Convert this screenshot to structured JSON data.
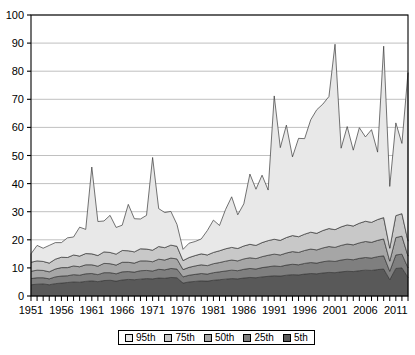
{
  "chart_data": {
    "type": "area",
    "title": "",
    "subtitle": "",
    "xlabel": "",
    "ylabel": "",
    "stacked": true,
    "grid": true,
    "grid_axis": "y",
    "legend_position": "bottom",
    "xlim": [
      1951,
      2013
    ],
    "ylim": [
      0,
      100
    ],
    "ytick_values": [
      0,
      10,
      20,
      30,
      40,
      50,
      60,
      70,
      80,
      90,
      100
    ],
    "ytick_labels": [
      "0",
      "10",
      "20",
      "30",
      "40",
      "50",
      "60",
      "70",
      "80",
      "90",
      "100"
    ],
    "xtick_labels": [
      "1951",
      "1956",
      "1961",
      "1966",
      "1971",
      "1976",
      "1981",
      "1986",
      "1991",
      "1996",
      "2001",
      "2006",
      "2011"
    ],
    "xtick_label_values": [
      1951,
      1956,
      1961,
      1966,
      1971,
      1976,
      1981,
      1986,
      1991,
      1996,
      2001,
      2006,
      2011
    ],
    "x": [
      1951,
      1952,
      1953,
      1954,
      1955,
      1956,
      1957,
      1958,
      1959,
      1960,
      1961,
      1962,
      1963,
      1964,
      1965,
      1966,
      1967,
      1968,
      1969,
      1970,
      1971,
      1972,
      1973,
      1974,
      1975,
      1976,
      1977,
      1978,
      1979,
      1980,
      1981,
      1982,
      1983,
      1984,
      1985,
      1986,
      1987,
      1988,
      1989,
      1990,
      1991,
      1992,
      1993,
      1994,
      1995,
      1996,
      1997,
      1998,
      1999,
      2000,
      2001,
      2002,
      2003,
      2004,
      2005,
      2006,
      2007,
      2008,
      2009,
      2010,
      2011,
      2012,
      2013
    ],
    "series": [
      {
        "name": "5th",
        "color": "#595959",
        "values": [
          4.0,
          4.2,
          4.3,
          4.0,
          4.4,
          4.6,
          4.8,
          5.0,
          4.9,
          5.2,
          5.4,
          5.1,
          5.5,
          5.6,
          5.3,
          5.7,
          5.9,
          5.8,
          6.0,
          6.2,
          6.1,
          6.4,
          6.3,
          6.6,
          6.5,
          4.6,
          5.0,
          5.2,
          5.4,
          5.3,
          5.6,
          5.8,
          6.0,
          6.2,
          6.1,
          6.4,
          6.6,
          6.5,
          6.8,
          7.0,
          7.2,
          7.1,
          7.4,
          7.6,
          7.5,
          7.8,
          8.0,
          7.9,
          8.2,
          8.4,
          8.3,
          8.6,
          8.8,
          8.7,
          9.0,
          9.2,
          9.1,
          9.4,
          9.6,
          5.8,
          9.8,
          10.0,
          6.6
        ]
      },
      {
        "name": "25th",
        "color": "#7f7f7f",
        "values": [
          2.2,
          2.3,
          2.2,
          2.1,
          2.4,
          2.5,
          2.4,
          2.6,
          2.5,
          2.7,
          2.6,
          2.5,
          2.8,
          2.7,
          2.6,
          2.9,
          2.8,
          2.7,
          3.0,
          2.9,
          2.8,
          3.1,
          3.0,
          3.2,
          3.1,
          2.2,
          2.4,
          2.5,
          2.6,
          2.5,
          2.7,
          2.8,
          2.9,
          3.0,
          2.9,
          3.1,
          3.2,
          3.1,
          3.3,
          3.4,
          3.5,
          3.4,
          3.6,
          3.7,
          3.6,
          3.8,
          3.9,
          3.8,
          4.0,
          4.1,
          4.0,
          4.2,
          4.3,
          4.2,
          4.4,
          4.5,
          4.4,
          4.6,
          4.7,
          3.0,
          4.8,
          4.9,
          3.4
        ]
      },
      {
        "name": "50th",
        "color": "#a6a6a6",
        "values": [
          2.6,
          2.7,
          2.6,
          2.5,
          2.8,
          3.0,
          2.9,
          3.1,
          3.0,
          3.2,
          3.1,
          3.0,
          3.3,
          3.2,
          3.1,
          3.4,
          3.3,
          3.2,
          3.5,
          3.4,
          3.3,
          3.6,
          3.5,
          3.7,
          3.6,
          2.6,
          2.8,
          3.0,
          3.1,
          3.0,
          3.2,
          3.3,
          3.5,
          3.6,
          3.5,
          3.7,
          3.8,
          3.7,
          3.9,
          4.1,
          4.2,
          4.1,
          4.3,
          4.5,
          4.4,
          4.6,
          4.8,
          4.7,
          4.9,
          5.1,
          5.0,
          5.2,
          5.4,
          5.3,
          5.5,
          5.7,
          5.6,
          5.8,
          6.0,
          3.6,
          6.2,
          6.4,
          4.2
        ]
      },
      {
        "name": "75th",
        "color": "#c8c8c8",
        "values": [
          3.2,
          3.3,
          3.2,
          3.1,
          3.5,
          3.7,
          3.6,
          3.9,
          3.8,
          4.0,
          3.9,
          3.8,
          4.1,
          4.0,
          3.9,
          4.2,
          4.1,
          4.0,
          4.3,
          4.2,
          4.1,
          4.5,
          4.4,
          4.6,
          4.5,
          3.2,
          3.5,
          3.7,
          3.9,
          3.8,
          4.0,
          4.2,
          4.4,
          4.5,
          4.4,
          4.6,
          4.8,
          4.7,
          5.0,
          5.2,
          5.3,
          5.2,
          5.5,
          5.7,
          5.6,
          5.8,
          6.0,
          5.9,
          6.2,
          6.4,
          6.3,
          6.6,
          6.8,
          6.7,
          7.0,
          7.2,
          7.1,
          7.4,
          7.6,
          4.6,
          7.8,
          8.0,
          5.3
        ]
      },
      {
        "name": "95th",
        "color": "#e8e8e8",
        "values": [
          3.0,
          5.5,
          4.7,
          6.3,
          5.9,
          5.2,
          7.0,
          6.4,
          10.3,
          8.6,
          30.9,
          12.1,
          11.0,
          13.2,
          9.5,
          9.0,
          16.5,
          11.8,
          10.6,
          12.0,
          33.0,
          13.5,
          12.5,
          12.0,
          7.8,
          4.0,
          5.1,
          5.0,
          5.3,
          8.7,
          11.5,
          9.0,
          14.0,
          18.0,
          12.0,
          15.0,
          25.0,
          20.0,
          24.0,
          18.0,
          51.0,
          33.0,
          40.0,
          28.0,
          35.0,
          34.0,
          40.0,
          44.0,
          45.0,
          47.0,
          66.0,
          28.0,
          35.0,
          27.0,
          34.0,
          30.0,
          33.0,
          24.0,
          61.0,
          22.0,
          33.0,
          25.0,
          60.0
        ]
      }
    ]
  },
  "legend": {
    "items": [
      {
        "label": "95th",
        "color": "#e8e8e8"
      },
      {
        "label": "75th",
        "color": "#c8c8c8"
      },
      {
        "label": "50th",
        "color": "#a6a6a6"
      },
      {
        "label": "25th",
        "color": "#7f7f7f"
      },
      {
        "label": "5th",
        "color": "#595959"
      }
    ]
  },
  "axes": {
    "axis_line_color": "#000000",
    "grid_color": "#b0b0b0",
    "outline_color": "#000000"
  }
}
